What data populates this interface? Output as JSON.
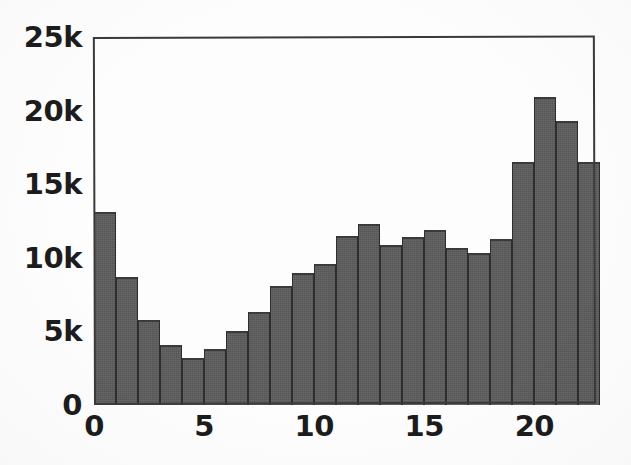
{
  "figure": {
    "background_color": "#fdfdfd",
    "bar_color": "#5c5c5c",
    "axis_color": "#3a3a3a",
    "text_color": "#1c1c1c"
  },
  "chart_data": {
    "type": "bar",
    "title": "",
    "subtitle": "",
    "xlabel": "",
    "ylabel": "",
    "legend": [],
    "grid": false,
    "xlim": [
      0,
      22.8
    ],
    "ylim": [
      0,
      25000
    ],
    "xticks": [
      0,
      5,
      10,
      15,
      20
    ],
    "xtick_labels": [
      "0",
      "5",
      "10",
      "15",
      "20"
    ],
    "yticks": [
      0,
      5000,
      10000,
      15000,
      20000,
      25000
    ],
    "ytick_labels": [
      "0",
      "5k",
      "10k",
      "15k",
      "20k",
      "25k"
    ],
    "bin_width": 1,
    "bin_starts": [
      0,
      1,
      2,
      3,
      4,
      5,
      6,
      7,
      8,
      9,
      10,
      11,
      12,
      13,
      14,
      15,
      16,
      17,
      18,
      19,
      20,
      21,
      22
    ],
    "categories": [
      "0",
      "1",
      "2",
      "3",
      "4",
      "5",
      "6",
      "7",
      "8",
      "9",
      "10",
      "11",
      "12",
      "13",
      "14",
      "15",
      "16",
      "17",
      "18",
      "19",
      "20",
      "21",
      "22"
    ],
    "values": [
      13100,
      8700,
      5800,
      4100,
      3200,
      3800,
      5000,
      6300,
      8100,
      9000,
      9600,
      11500,
      12300,
      10900,
      11400,
      11900,
      10700,
      10300,
      11300,
      16500,
      20900,
      19300,
      16500
    ]
  }
}
